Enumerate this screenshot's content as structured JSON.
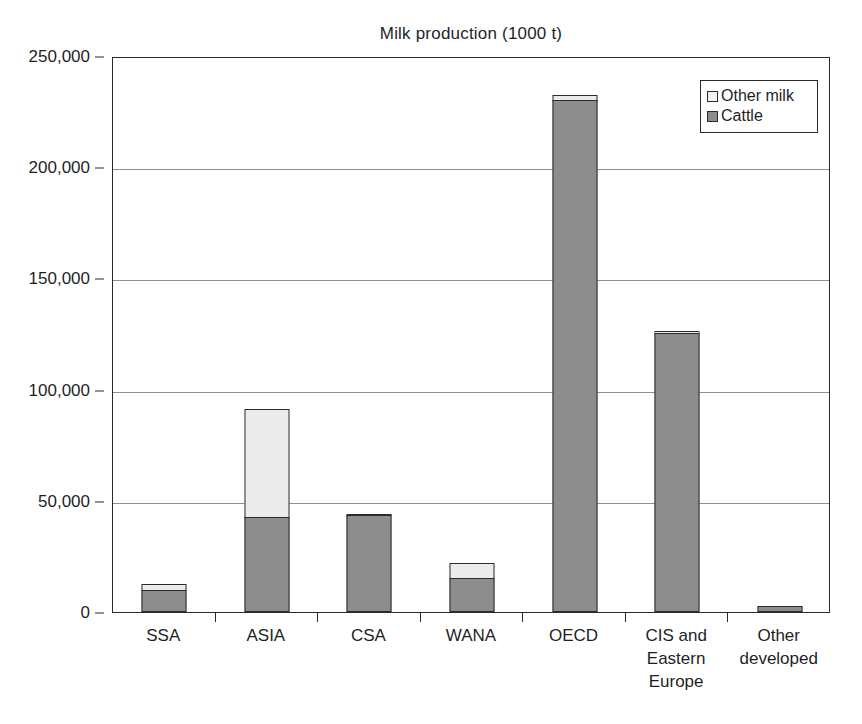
{
  "chart_data": {
    "type": "bar",
    "title": "Milk production (1000 t)",
    "xlabel": "",
    "ylabel": "",
    "ylim": [
      0,
      250000
    ],
    "ytick_labels": [
      "250,000",
      "200,000",
      "150,000",
      "100,000",
      "50,000",
      "0"
    ],
    "yticks": [
      250000,
      200000,
      150000,
      100000,
      50000,
      0
    ],
    "grid": true,
    "stacked": true,
    "legend_position": "top-right",
    "categories": [
      "SSA",
      "ASIA",
      "CSA",
      "WANA",
      "OECD",
      "CIS and Eastern Europe",
      "Other developed"
    ],
    "category_lines": [
      [
        "SSA"
      ],
      [
        "ASIA"
      ],
      [
        "CSA"
      ],
      [
        "WANA"
      ],
      [
        "OECD"
      ],
      [
        "CIS and",
        "Eastern",
        "Europe"
      ],
      [
        "Other",
        "developed"
      ]
    ],
    "series": [
      {
        "name": "Cattle",
        "color": "#8d8d8d",
        "values": [
          10000,
          42500,
          43500,
          15500,
          230000,
          125500,
          2500
        ]
      },
      {
        "name": "Other milk",
        "color": "#ebebeb",
        "values": [
          3000,
          49500,
          500,
          7000,
          3000,
          1500,
          0
        ]
      }
    ],
    "totals": [
      13000,
      92000,
      44000,
      22500,
      233000,
      127000,
      2500
    ]
  },
  "legend": {
    "items": [
      {
        "label": "Other milk",
        "swatch": "other"
      },
      {
        "label": "Cattle",
        "swatch": "cattle"
      }
    ]
  },
  "colors": {
    "cattle": "#8d8d8d",
    "other_milk": "#ebebeb",
    "axis": "#2a2a2a",
    "gridline": "#8e8e8e",
    "text": "#1f1f1f",
    "background": "#ffffff"
  }
}
